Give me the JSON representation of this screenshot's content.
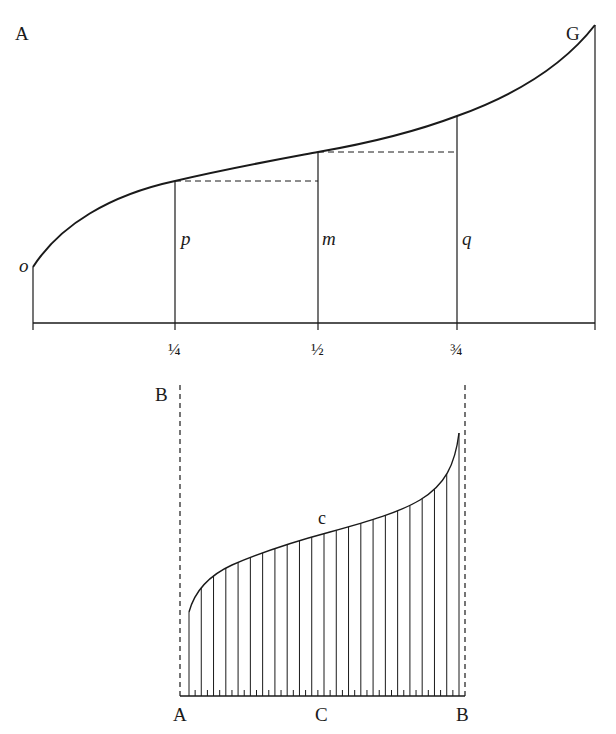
{
  "figure_top": {
    "corner_label": "A",
    "end_label": "G",
    "ordinate_labels": {
      "origin": "o",
      "quarter": "p",
      "half": "m",
      "three_quarter": "q"
    },
    "axis_ticks": [
      "¼",
      "½",
      "¾"
    ]
  },
  "figure_bottom": {
    "corner_label": "B",
    "curve_label": "c",
    "baseline_labels": {
      "left": "A",
      "middle": "C",
      "right": "B"
    },
    "hatch_count": 23
  },
  "colors": {
    "ink": "#1a1a1a",
    "background": "#ffffff"
  }
}
